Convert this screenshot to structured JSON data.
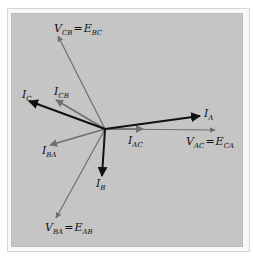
{
  "diagram": {
    "origin": [
      105,
      129
    ],
    "colors": {
      "background": "#c5c5c5",
      "current_line": "#111111",
      "voltage_line": "#6f6f6f",
      "delta_current_line": "#6f6f6f"
    },
    "phasors": [
      {
        "id": "V_CB",
        "main": "V",
        "sub": "CB",
        "eq_main": "E",
        "eq_sub": "BC",
        "tip": [
          58,
          36
        ],
        "color": "gray",
        "label_pos": [
          46,
          30
        ]
      },
      {
        "id": "I_C",
        "main": "I",
        "sub": "C",
        "tip": [
          29,
          101
        ],
        "color": "black",
        "label_pos": [
          22,
          95
        ]
      },
      {
        "id": "I_CB",
        "main": "I",
        "sub": "CB",
        "tip": [
          56,
          100
        ],
        "color": "gray",
        "label_pos": [
          52,
          93
        ]
      },
      {
        "id": "I_A",
        "main": "I",
        "sub": "A",
        "tip": [
          200,
          116
        ],
        "color": "black",
        "label_pos": [
          204,
          116
        ]
      },
      {
        "id": "I_AC",
        "main": "I",
        "sub": "AC",
        "tip": [
          143,
          129
        ],
        "color": "gray",
        "label_pos": [
          127,
          144
        ]
      },
      {
        "id": "V_AC",
        "main": "V",
        "sub": "AC",
        "eq_main": "E",
        "eq_sub": "CA",
        "tip": [
          215,
          130
        ],
        "color": "gray",
        "label_pos": [
          186,
          145
        ]
      },
      {
        "id": "I_BA",
        "main": "I",
        "sub": "BA",
        "tip": [
          50,
          145
        ],
        "color": "gray",
        "label_pos": [
          42,
          155
        ]
      },
      {
        "id": "I_B",
        "main": "I",
        "sub": "B",
        "tip": [
          102,
          176
        ],
        "color": "black",
        "label_pos": [
          96,
          188
        ]
      },
      {
        "id": "V_BA",
        "main": "V",
        "sub": "BA",
        "eq_main": "E",
        "eq_sub": "AB",
        "tip": [
          56,
          218
        ],
        "color": "gray",
        "label_pos": [
          44,
          231
        ]
      }
    ],
    "labels": {
      "v_cb": {
        "main": "V",
        "sub": "CB",
        "eq": "=",
        "eq_main": "E",
        "eq_sub": "BC"
      },
      "i_c": {
        "main": "I",
        "sub": "C"
      },
      "i_cb": {
        "main": "I",
        "sub": "CB"
      },
      "i_a": {
        "main": "I",
        "sub": "A"
      },
      "i_ac": {
        "main": "I",
        "sub": "AC"
      },
      "v_ac": {
        "main": "V",
        "sub": "AC",
        "eq": "=",
        "eq_main": "E",
        "eq_sub": "CA"
      },
      "i_ba": {
        "main": "I",
        "sub": "BA"
      },
      "i_b": {
        "main": "I",
        "sub": "B"
      },
      "v_ba": {
        "main": "V",
        "sub": "BA",
        "eq": "=",
        "eq_main": "E",
        "eq_sub": "AB"
      }
    }
  }
}
